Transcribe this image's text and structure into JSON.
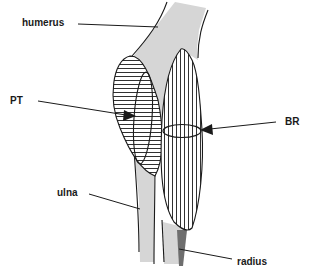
{
  "diagram": {
    "labels": {
      "humerus": "humerus",
      "pt": "PT",
      "br": "BR",
      "ulna": "ulna",
      "radius": "radius"
    },
    "colors": {
      "bone_fill": "#d6d6d6",
      "radius_dark": "#6e6e6e",
      "outline": "#1a1a1a",
      "background": "#ffffff"
    },
    "structures": [
      {
        "name": "humerus",
        "type": "bone",
        "fill": "stippled light gray"
      },
      {
        "name": "PT",
        "type": "muscle",
        "fill": "horizontal hatching"
      },
      {
        "name": "BR",
        "type": "muscle",
        "fill": "vertical hatching"
      },
      {
        "name": "ulna",
        "type": "bone",
        "fill": "light gray"
      },
      {
        "name": "radius",
        "type": "bone",
        "fill": "dark gray"
      }
    ]
  }
}
